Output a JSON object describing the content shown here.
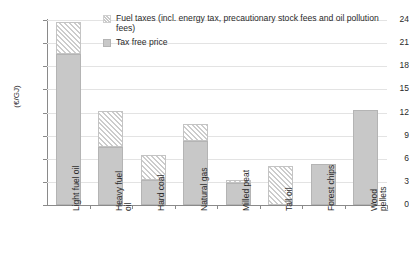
{
  "chart_data": {
    "type": "bar",
    "stacked": true,
    "title": "",
    "xlabel": "",
    "ylabel": "(€/GJ)",
    "ylim": [
      0,
      24
    ],
    "ytick_step": 3,
    "yticks": [
      "24",
      "21",
      "18",
      "15",
      "12",
      "9",
      "6",
      "3",
      "0"
    ],
    "grid": true,
    "legend_position": "top-center",
    "categories": [
      "Light fuel oil",
      "Heavy fuel oil",
      "Hard coal",
      "Natural gas",
      "Milled peat",
      "Tall oil",
      "Forest chips",
      "Wood pellets"
    ],
    "series": [
      {
        "name": "Tax free price",
        "values": [
          19.6,
          7.5,
          3.2,
          8.3,
          2.9,
          0.0,
          5.3,
          12.3
        ]
      },
      {
        "name": "Fuel taxes (incl. energy tax, precautionary stock fees and oil pollution fees)",
        "values": [
          4.1,
          4.7,
          3.3,
          2.2,
          0.4,
          5.0,
          0.0,
          0.0
        ]
      }
    ],
    "totals": [
      23.7,
      12.2,
      6.5,
      10.5,
      3.3,
      5.0,
      5.3,
      12.3
    ]
  },
  "legend": {
    "items": [
      {
        "label": "Fuel taxes (incl. energy tax, precautionary stock fees and oil pollution fees)",
        "swatch": "hatched"
      },
      {
        "label": "Tax free price",
        "swatch": "solid-gray"
      }
    ]
  },
  "colors": {
    "tax_free_fill": "#c8c8c8",
    "tax_free_border": "#b4b4b4",
    "tax_hatch_border": "#c4c4c4",
    "gridline": "#e3e3e3",
    "axis": "#8a8a8a",
    "text": "#2a2a2a",
    "background": "#ffffff"
  },
  "axis": {
    "y_title": "(€/GJ)",
    "y_labels": [
      "24",
      "21",
      "18",
      "15",
      "12",
      "9",
      "6",
      "3",
      "0"
    ],
    "x_labels": [
      "Light fuel oil",
      "Heavy fuel\noil",
      "Hard coal",
      "Natural gas",
      "Milled peat",
      "Tall oil",
      "Forest chips",
      "Wood\npellets"
    ]
  }
}
